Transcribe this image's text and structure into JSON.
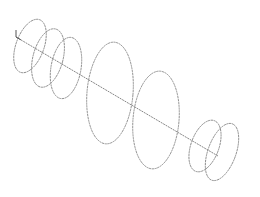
{
  "diagram": {
    "colors": {
      "stroke": "#8a8a8a",
      "axis": "#7a7a7a",
      "background": "#ffffff"
    },
    "axis": {
      "x1": 16,
      "y1": 37,
      "x2": 218,
      "y2": 156
    },
    "origin_mark": {
      "x": 16,
      "y": 37,
      "len": 7
    },
    "rings": [
      {
        "cx": 30,
        "cy": 46,
        "rx": 14,
        "ry": 28,
        "rot": 20
      },
      {
        "cx": 48,
        "cy": 58,
        "rx": 15,
        "ry": 30,
        "rot": 15
      },
      {
        "cx": 66,
        "cy": 68,
        "rx": 15,
        "ry": 31,
        "rot": 10
      },
      {
        "cx": 110,
        "cy": 93,
        "rx": 23,
        "ry": 51,
        "rot": 5
      },
      {
        "cx": 156,
        "cy": 120,
        "rx": 23,
        "ry": 49,
        "rot": 5
      },
      {
        "cx": 205,
        "cy": 146,
        "rx": 14,
        "ry": 27,
        "rot": 20
      },
      {
        "cx": 222,
        "cy": 152,
        "rx": 14,
        "ry": 30,
        "rot": 20
      }
    ]
  }
}
